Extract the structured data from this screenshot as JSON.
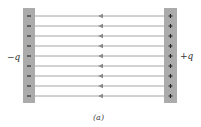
{
  "figure": {
    "caption": "(a)",
    "left_plate": {
      "label": "−q",
      "charge_sign": "−",
      "charge_count": 9,
      "color": "#a9a9a9"
    },
    "right_plate": {
      "label": "+q",
      "charge_sign": "+",
      "charge_count": 9,
      "color": "#a9a9a9"
    },
    "field_lines": {
      "count": 9,
      "direction": "left",
      "color": "#8a8a8a"
    }
  }
}
